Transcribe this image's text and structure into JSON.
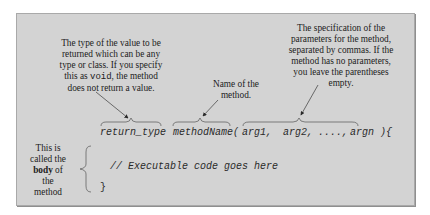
{
  "annotations": {
    "return_type_note": {
      "before_keyword": "The type of the value to be returned which can be any type or class. If you specify this as ",
      "keyword": "void",
      "after_keyword": ", the method does not return a value.",
      "lines": [
        "The type of the value to be",
        "returned which can be any",
        "type or class. If you specify",
        "this as ",
        "void",
        ", the method",
        "does not return a value."
      ]
    },
    "method_name_note": {
      "lines": [
        "Name of the",
        "method."
      ]
    },
    "parameters_note": {
      "lines": [
        "The specification of the",
        "parameters for the method,",
        "separated by commas. If the",
        "method has no parameters,",
        "you leave the parentheses",
        "empty."
      ]
    },
    "body_note": {
      "lines": [
        "This is",
        "called the",
        "body",
        " of",
        "the",
        "method"
      ]
    }
  },
  "code": {
    "return_type": "return_type",
    "method_name": "methodName(",
    "arg1": "arg1,",
    "arg2": "arg2,",
    "ellipsis": "....,",
    "argn": "argn ){",
    "body_comment": "// Executable code goes here",
    "closing_brace": "}"
  },
  "colors": {
    "panel_background": "#d3d3d3",
    "panel_border": "#a9a9a9",
    "text": "#1c1c1c",
    "arrow": "#3a3a3a"
  }
}
